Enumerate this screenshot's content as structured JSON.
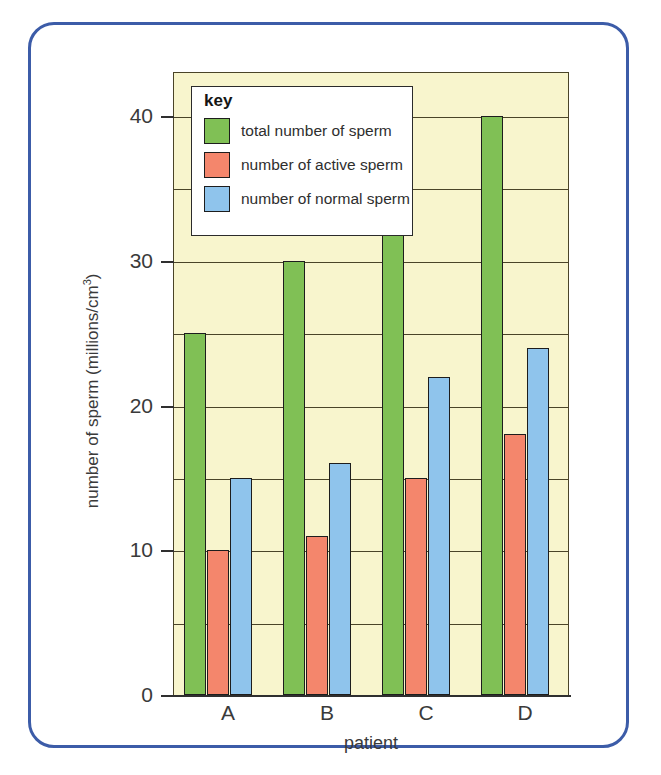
{
  "figure": {
    "frame_color": "#3c5ca8",
    "background": "#ffffff"
  },
  "chart_data": {
    "type": "bar",
    "title": "",
    "categories": [
      "A",
      "B",
      "C",
      "D"
    ],
    "series": [
      {
        "name": "total number of sperm",
        "color": "#80c055",
        "values": [
          25,
          30,
          35,
          40
        ]
      },
      {
        "name": "number of active sperm",
        "color": "#f4866c",
        "values": [
          10,
          11,
          15,
          18
        ]
      },
      {
        "name": "number of normal sperm",
        "color": "#8fc4ec",
        "values": [
          15,
          16,
          22,
          24
        ]
      }
    ],
    "xlabel": "patient",
    "ylabel": "number of sperm (millions/cm",
    "ylabel_superscript": "3",
    "ylabel_suffix": ")",
    "ylim": [
      0,
      43
    ],
    "ytick_labels": [
      "0",
      "10",
      "20",
      "30",
      "40"
    ],
    "ytick_values": [
      0,
      10,
      20,
      30,
      40
    ],
    "gridline_values": [
      5,
      10,
      15,
      20,
      25,
      30,
      35,
      40
    ],
    "grid": true,
    "plot_background": "#f8f5cd",
    "legend_position": "upper-left-inside"
  },
  "legend": {
    "title": "key",
    "entries": [
      {
        "label": "total number of sperm",
        "color": "#80c055",
        "icon": "green-swatch-icon"
      },
      {
        "label": "number of active sperm",
        "color": "#f4866c",
        "icon": "red-swatch-icon"
      },
      {
        "label": "number of normal sperm",
        "color": "#8fc4ec",
        "icon": "blue-swatch-icon"
      }
    ]
  }
}
